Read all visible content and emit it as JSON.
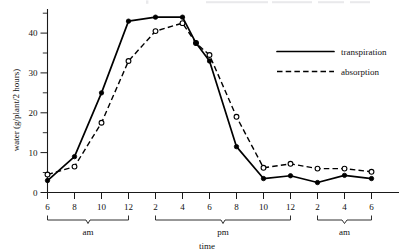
{
  "figure": {
    "background": "#ffffff",
    "ink_color": "#000000"
  },
  "axes": {
    "y": {
      "label": "water (g/plant/2 hours)",
      "ticklabels": [
        "0",
        "10",
        "20",
        "30",
        "40"
      ],
      "tickvalues": [
        0,
        10,
        20,
        30,
        40
      ],
      "minor_tickvalues": [
        5,
        15,
        25,
        35,
        45
      ],
      "range": [
        0,
        46
      ]
    },
    "x": {
      "label": "time",
      "ticklabels": [
        "6",
        "8",
        "10",
        "12",
        "2",
        "4",
        "6",
        "8",
        "10",
        "12",
        "2",
        "4",
        "6"
      ],
      "groups": [
        {
          "label": "am",
          "start_index": 0,
          "end_index": 3
        },
        {
          "label": "pm",
          "start_index": 4,
          "end_index": 9
        },
        {
          "label": "am",
          "start_index": 10,
          "end_index": 12
        }
      ]
    }
  },
  "legend": {
    "position": "upper-right",
    "entries": [
      {
        "name": "transpiration-legend",
        "label": "transpiration",
        "style": "solid"
      },
      {
        "name": "absorption-legend",
        "label": "absorption",
        "style": "dashed"
      }
    ]
  },
  "chart_data": {
    "type": "line",
    "title": "",
    "xlabel": "time",
    "ylabel": "water (g/plant/2 hours)",
    "ylim": [
      0,
      46
    ],
    "grid": false,
    "legend_position": "upper right",
    "x_ticklabels": [
      "6",
      "8",
      "10",
      "12",
      "2",
      "4",
      "6",
      "8",
      "10",
      "12",
      "2",
      "4",
      "6"
    ],
    "x": [
      6,
      8,
      10,
      12,
      14,
      16,
      17,
      18,
      20,
      22,
      24,
      26,
      28,
      30
    ],
    "x_display": [
      "6 am",
      "8 am",
      "10 am",
      "12 pm",
      "2 pm",
      "4 pm",
      "5 pm",
      "6 pm",
      "8 pm",
      "10 pm",
      "12 am",
      "2 am",
      "4 am",
      "6 am"
    ],
    "series": [
      {
        "name": "transpiration",
        "style": "solid",
        "marker": "filled-circle",
        "values": [
          3.0,
          9.0,
          25.0,
          43.0,
          44.0,
          44.0,
          37.5,
          33.0,
          11.5,
          3.5,
          4.2,
          2.5,
          4.3,
          3.5
        ]
      },
      {
        "name": "absorption",
        "style": "dashed",
        "marker": "open-circle",
        "values": [
          4.5,
          6.5,
          17.5,
          33.0,
          40.5,
          42.5,
          37.5,
          34.5,
          19.0,
          6.2,
          7.2,
          6.0,
          6.0,
          5.2
        ]
      }
    ]
  }
}
